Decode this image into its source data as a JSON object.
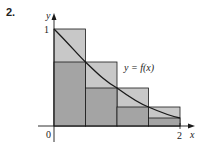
{
  "problem": {
    "number": "2."
  },
  "figure": {
    "y_axis_label": "y",
    "x_axis_label": "x",
    "origin_label": "0",
    "y_tick_label": "1",
    "x_tick_label": "2",
    "curve_label": "y = f(x)",
    "colors": {
      "upper_rect": "#c8c8c8",
      "lower_rect": "#a4a4a4",
      "stroke": "#1a1a1a"
    },
    "partition": [
      0,
      0.5,
      1.0,
      1.5,
      2.0
    ],
    "upper_heights": [
      1.0,
      0.66,
      0.39,
      0.19
    ],
    "lower_heights": [
      0.66,
      0.39,
      0.19,
      0.08
    ]
  }
}
